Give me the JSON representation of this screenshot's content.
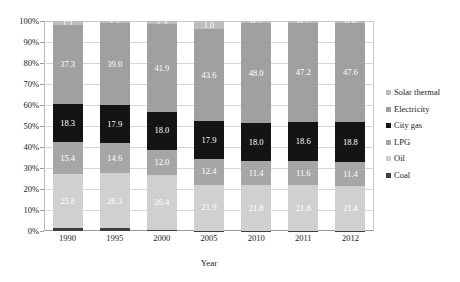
{
  "chart_data": {
    "type": "bar",
    "stacked": true,
    "normalized": true,
    "title": "",
    "xlabel": "Year",
    "ylabel": "",
    "categories": [
      "1990",
      "1995",
      "2000",
      "2005",
      "2010",
      "2011",
      "2012"
    ],
    "ylim": [
      0,
      100
    ],
    "ytick_labels": [
      "0%",
      "10%",
      "20%",
      "30%",
      "40%",
      "50%",
      "60%",
      "70%",
      "80%",
      "90%",
      "100%"
    ],
    "ytick_values": [
      0,
      10,
      20,
      30,
      40,
      50,
      60,
      70,
      80,
      90,
      100
    ],
    "grid": true,
    "legend_position": "right",
    "series": [
      {
        "name": "Coal",
        "color": "#3f3f3f",
        "values": [
          1.2,
          1.2,
          0.4,
          0.2,
          0.1,
          0.1,
          0.1
        ],
        "labels": [
          "",
          "",
          "",
          "",
          "",
          "",
          ""
        ],
        "label_color": "#ffffff"
      },
      {
        "name": "Oil",
        "color": "#d0d0d0",
        "values": [
          25.8,
          26.3,
          26.4,
          21.9,
          21.8,
          21.8,
          21.4
        ],
        "labels": [
          "25.8",
          "26.3",
          "26.4",
          "21.9",
          "21.8",
          "21.8",
          "21.4"
        ],
        "label_color": "#ffffff"
      },
      {
        "name": "LPG",
        "color": "#a6a6a6",
        "values": [
          15.4,
          14.6,
          12.0,
          12.4,
          11.4,
          11.6,
          11.4
        ],
        "labels": [
          "15.4",
          "14.6",
          "12.0",
          "12.4",
          "11.4",
          "11.6",
          "11.4"
        ],
        "label_color": "#ffffff"
      },
      {
        "name": "City gas",
        "color": "#141414",
        "values": [
          18.3,
          17.9,
          18.0,
          17.9,
          18.0,
          18.6,
          18.8
        ],
        "labels": [
          "18.3",
          "17.9",
          "18.0",
          "17.9",
          "18.0",
          "18.6",
          "18.8"
        ],
        "label_color": "#ffffff"
      },
      {
        "name": "Electricity",
        "color": "#a0a0a0",
        "values": [
          37.3,
          39.0,
          41.9,
          43.6,
          48.0,
          47.2,
          47.6
        ],
        "labels": [
          "37.3",
          "39.0",
          "41.9",
          "43.6",
          "48.0",
          "47.2",
          "47.6"
        ],
        "label_color": "#ffffff"
      },
      {
        "name": "Solar thermal",
        "color": "#bdbdbd",
        "values": [
          2.0,
          1.0,
          1.3,
          4.0,
          0.7,
          0.7,
          0.7
        ],
        "labels": [
          "1.1",
          "1.1",
          "1.3",
          "1.0",
          "0.7",
          "0.7",
          "0.6"
        ],
        "label_color": "#ffffff"
      }
    ]
  },
  "legend": {
    "items": [
      {
        "label": "Solar thermal",
        "color": "#bdbdbd"
      },
      {
        "label": "Electricity",
        "color": "#a0a0a0"
      },
      {
        "label": "City gas",
        "color": "#141414"
      },
      {
        "label": "LPG",
        "color": "#a6a6a6"
      },
      {
        "label": "Oil",
        "color": "#d0d0d0"
      },
      {
        "label": "Coal",
        "color": "#3f3f3f"
      }
    ]
  }
}
